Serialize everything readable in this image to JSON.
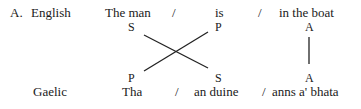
{
  "section_label": "A.",
  "rows": {
    "english": {
      "language": "English",
      "segments": [
        "The man",
        "is",
        "in the boat"
      ],
      "functions": [
        "S",
        "P",
        "A"
      ],
      "separator": "/"
    },
    "gaelic": {
      "language": "Gaelic",
      "segments": [
        "Tha",
        "an duine",
        "anns a' bhata"
      ],
      "functions": [
        "P",
        "S",
        "A"
      ],
      "separator": "/"
    }
  },
  "links": [
    {
      "from": "English S",
      "to": "Gaelic S"
    },
    {
      "from": "English P",
      "to": "Gaelic P"
    },
    {
      "from": "English A",
      "to": "Gaelic A"
    }
  ]
}
